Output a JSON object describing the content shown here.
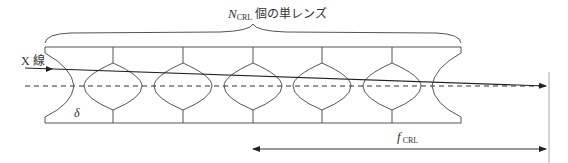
{
  "diagram": {
    "title_label": {
      "symbol": "N",
      "subscript": "CRL",
      "text": "個の単レンズ"
    },
    "xray_label": "X 線",
    "delta_label": "δ",
    "focal_label": {
      "symbol": "f",
      "subscript": "CRL"
    },
    "lens_count": 7,
    "colors": {
      "line": "#555555",
      "beam": "#222222",
      "focal_plane": "#aaaaaa"
    }
  }
}
